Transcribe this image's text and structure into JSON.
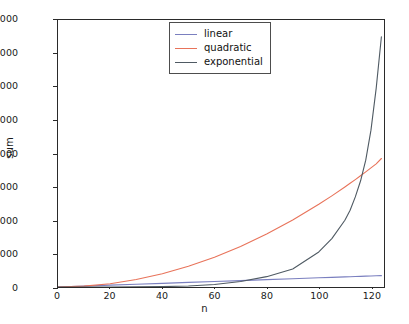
{
  "chart_data": {
    "type": "line",
    "title": "",
    "xlabel": "n",
    "ylabel": "sum",
    "xlim": [
      0,
      125
    ],
    "ylim": [
      0,
      16000
    ],
    "grid": false,
    "legend_position": "upper center",
    "xticks": [
      0,
      20,
      40,
      60,
      80,
      100,
      120
    ],
    "yticks": [
      0,
      2000,
      4000,
      6000,
      8000,
      10000,
      12000,
      14000,
      16000
    ],
    "xtick_labels": [
      "0",
      "20",
      "40",
      "60",
      "80",
      "100",
      "120"
    ],
    "ytick_labels": [
      "0",
      "2000",
      "4000",
      "6000",
      "8000",
      "10000",
      "12000",
      "14000",
      "16000"
    ],
    "x": [
      0,
      10,
      20,
      30,
      40,
      50,
      60,
      70,
      80,
      90,
      100,
      105,
      110,
      112,
      114,
      116,
      118,
      120,
      122,
      124
    ],
    "series": [
      {
        "name": "linear",
        "color": "#7a7fbf",
        "values": [
          0,
          55,
          110,
          165,
          220,
          275,
          330,
          385,
          440,
          495,
          550,
          578,
          605,
          616,
          627,
          638,
          649,
          660,
          671,
          682
        ]
      },
      {
        "name": "quadratic",
        "color": "#e8735a",
        "values": [
          0,
          50,
          198,
          446,
          793,
          1239,
          1784,
          2428,
          3171,
          4013,
          4954,
          5462,
          5994,
          6213,
          6437,
          6666,
          6899,
          7137,
          7380,
          7700
        ]
      },
      {
        "name": "exponential",
        "color": "#4f5a63",
        "values": [
          0,
          1,
          3,
          8,
          22,
          58,
          152,
          330,
          620,
          1080,
          2100,
          2900,
          4000,
          4600,
          5400,
          6350,
          7600,
          9400,
          11900,
          15000
        ]
      }
    ]
  },
  "legend": {
    "entries": [
      {
        "label": "linear",
        "color": "#7a7fbf"
      },
      {
        "label": "quadratic",
        "color": "#e8735a"
      },
      {
        "label": "exponential",
        "color": "#4f5a63"
      }
    ]
  },
  "axes": {
    "x_axis_label": "n",
    "y_axis_label": "sum"
  }
}
